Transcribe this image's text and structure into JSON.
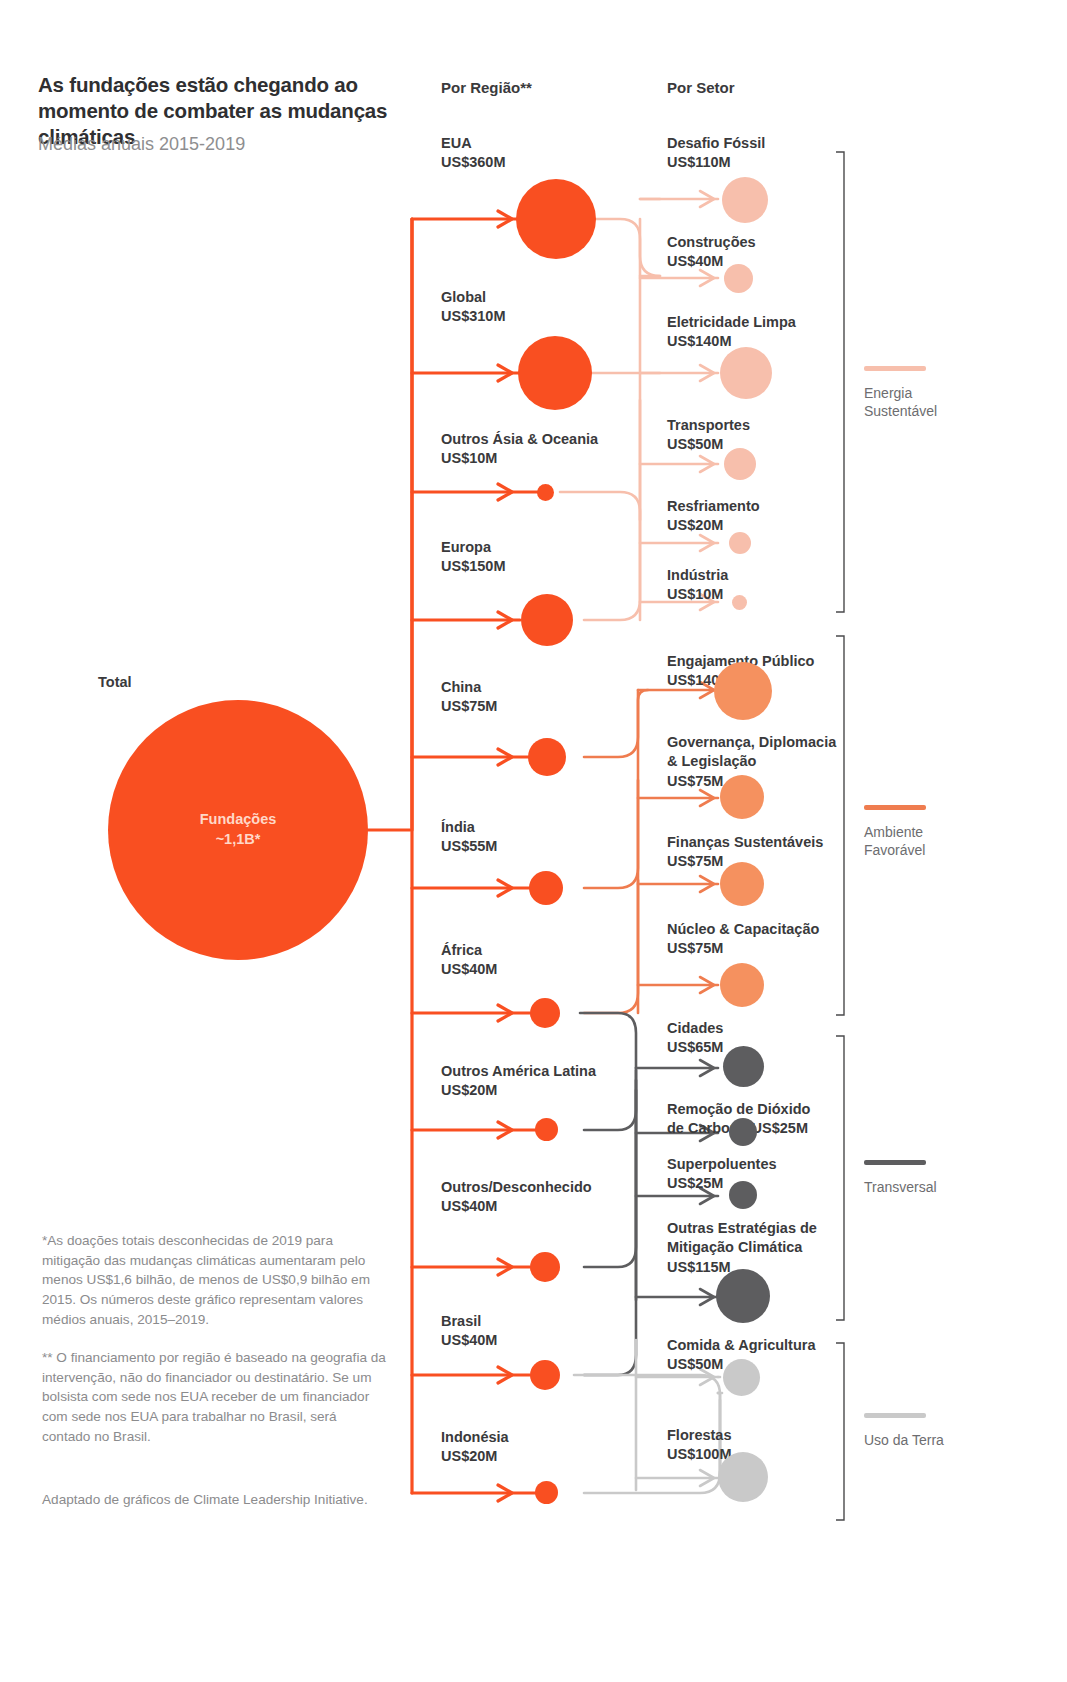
{
  "header": {
    "title": "As fundações estão chegando ao momento de combater as mudanças climáticas",
    "subtitle": "Médias anuais 2015-2019",
    "col_region": "Por Região**",
    "col_sector": "Por Setor"
  },
  "total": {
    "label": "Total",
    "name": "Fundações",
    "value": "~1,1B*"
  },
  "regions": [
    {
      "name": "EUA",
      "value": "US$360M",
      "amount": 360
    },
    {
      "name": "Global",
      "value": "US$310M",
      "amount": 310
    },
    {
      "name": "Outros Ásia & Oceania",
      "value": "US$10M",
      "amount": 10
    },
    {
      "name": "Europa",
      "value": "US$150M",
      "amount": 150
    },
    {
      "name": "China",
      "value": "US$75M",
      "amount": 75
    },
    {
      "name": "Índia",
      "value": "US$55M",
      "amount": 55
    },
    {
      "name": "África",
      "value": "US$40M",
      "amount": 40
    },
    {
      "name": "Outros América Latina",
      "value": "US$20M",
      "amount": 20
    },
    {
      "name": "Outros/Desconhecido",
      "value": "US$40M",
      "amount": 40
    },
    {
      "name": "Brasil",
      "value": "US$40M",
      "amount": 40
    },
    {
      "name": "Indonésia",
      "value": "US$20M",
      "amount": 20
    }
  ],
  "sectors": [
    {
      "name": "Desafio Fóssil",
      "value": "US$110M",
      "amount": 110,
      "group": "energia"
    },
    {
      "name": "Construções",
      "value": "US$40M",
      "amount": 40,
      "group": "energia"
    },
    {
      "name": "Eletricidade Limpa",
      "value": "US$140M",
      "amount": 140,
      "group": "energia"
    },
    {
      "name": "Transportes",
      "value": "US$50M",
      "amount": 50,
      "group": "energia"
    },
    {
      "name": "Resfriamento",
      "value": "US$20M",
      "amount": 20,
      "group": "energia"
    },
    {
      "name": "Indústria",
      "value": "US$10M",
      "amount": 10,
      "group": "energia"
    },
    {
      "name": "Engajamento Público",
      "value": "US$140M",
      "amount": 140,
      "group": "ambiente"
    },
    {
      "name": "Governança, Diplomacia & Legislação",
      "value": "US$75M",
      "amount": 75,
      "group": "ambiente"
    },
    {
      "name": "Finanças Sustentáveis",
      "value": "US$75M",
      "amount": 75,
      "group": "ambiente"
    },
    {
      "name": "Núcleo & Capacitação",
      "value": "US$75M",
      "amount": 75,
      "group": "ambiente"
    },
    {
      "name": "Cidades",
      "value": "US$65M",
      "amount": 65,
      "group": "transversal"
    },
    {
      "name": "Remoção de Dióxido de Carbono",
      "value": "US$25M",
      "amount": 25,
      "group": "transversal"
    },
    {
      "name": "Superpoluentes",
      "value": "US$25M",
      "amount": 25,
      "group": "transversal"
    },
    {
      "name": "Outras Estratégias de Mitigação Climática",
      "value": "US$115M",
      "amount": 115,
      "group": "transversal"
    },
    {
      "name": "Comida & Agricultura",
      "value": "US$50M",
      "amount": 50,
      "group": "terra"
    },
    {
      "name": "Florestas",
      "value": "US$100M",
      "amount": 100,
      "group": "terra"
    }
  ],
  "legend": [
    {
      "label": "Energia Sustentável",
      "color": "#f7bfac"
    },
    {
      "label": "Ambiente Favorável",
      "color": "#ef7c4f"
    },
    {
      "label": "Transversal",
      "color": "#5d5d5f"
    },
    {
      "label": "Uso da Terra",
      "color": "#c9c9c9"
    }
  ],
  "footnotes": {
    "one": "*As doações totais desconhecidas de 2019 para mitigação das mudanças climáticas aumentaram pelo menos US$1,6 bilhão, de menos de US$0,9 bilhão em 2015. Os números deste gráfico representam valores médios anuais, 2015–2019.",
    "two": "** O financiamento por região é baseado na geografia da intervenção, não do financiador ou destinatário. Se um bolsista com sede nos EUA receber de um financiador com sede nos EUA para trabalhar no Brasil, será contado no Brasil.",
    "three": "Adaptado de gráficos de Climate Leadership Initiative."
  },
  "colors": {
    "orange": "#f94f21",
    "orange_mid": "#f5915f",
    "pink": "#f7bfac",
    "grey_dark": "#5d5d5f",
    "grey_light": "#c9c9c9"
  }
}
